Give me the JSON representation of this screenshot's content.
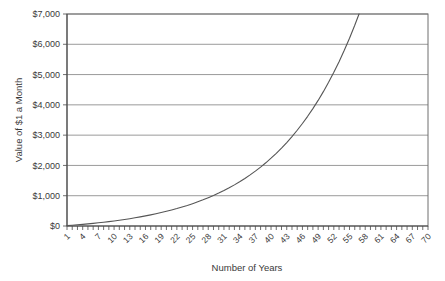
{
  "chart_data": {
    "type": "line",
    "title": "",
    "subtitle": "",
    "xlabel": "Number of Years",
    "ylabel": "Value of $1 a Month",
    "xlim": [
      1,
      70
    ],
    "ylim": [
      0,
      7000
    ],
    "grid": true,
    "legend": false,
    "legend_position": "none",
    "y_ticks": [
      0,
      1000,
      2000,
      3000,
      4000,
      5000,
      6000,
      7000
    ],
    "y_tick_labels": [
      "$0",
      "$1,000",
      "$2,000",
      "$3,000",
      "$4,000",
      "$5,000",
      "$6,000",
      "$7,000"
    ],
    "x_tick_labels": [
      "1",
      "4",
      "7",
      "10",
      "13",
      "16",
      "19",
      "22",
      "25",
      "28",
      "31",
      "34",
      "37",
      "40",
      "43",
      "46",
      "49",
      "52",
      "55",
      "58",
      "61",
      "64",
      "67",
      "70"
    ],
    "x_tick_values": [
      1,
      4,
      7,
      10,
      13,
      16,
      19,
      22,
      25,
      28,
      31,
      34,
      37,
      40,
      43,
      46,
      49,
      52,
      55,
      58,
      61,
      64,
      67,
      70
    ],
    "x_minor_tick_step": 1,
    "series": [
      {
        "name": "Value of $1 a Month",
        "color": "#555555",
        "x": [
          1,
          2,
          3,
          4,
          5,
          6,
          7,
          8,
          9,
          10,
          11,
          12,
          13,
          14,
          15,
          16,
          17,
          18,
          19,
          20,
          21,
          22,
          23,
          24,
          25,
          26,
          27,
          28,
          29,
          30,
          31,
          32,
          33,
          34,
          35,
          36,
          37,
          38,
          39,
          40,
          41,
          42,
          43,
          44,
          45,
          46,
          47,
          48,
          49,
          50,
          51,
          52,
          53,
          54,
          55,
          56,
          57,
          58,
          59,
          60,
          61,
          62,
          63,
          64,
          65,
          66,
          67,
          68,
          69,
          70
        ],
        "values": [
          12,
          25,
          39,
          54,
          70,
          87,
          105,
          124,
          145,
          167,
          190,
          215,
          242,
          270,
          301,
          333,
          367,
          404,
          443,
          485,
          529,
          576,
          627,
          680,
          738,
          799,
          864,
          934,
          1008,
          1087,
          1172,
          1262,
          1358,
          1461,
          1570,
          1687,
          1812,
          1945,
          2087,
          2239,
          2400,
          2572,
          2756,
          2952,
          3161,
          3384,
          3622,
          3876,
          4147,
          4436,
          4745,
          5074,
          5425,
          5800,
          6200,
          6627,
          7083,
          7570,
          8090,
          8646,
          9240,
          9874,
          10552,
          11276,
          12049,
          12875,
          13757,
          14700,
          15707,
          16783
        ]
      }
    ],
    "displayed_series_note": "exponential compound growth curve"
  },
  "chart_render": {
    "y_axis_title": "Value of $1 a Month",
    "x_axis_title": "Number of Years",
    "curve_points_x": [
      1,
      4,
      7,
      10,
      13,
      16,
      19,
      22,
      25,
      28,
      31,
      34,
      37,
      40,
      43,
      46,
      49,
      52,
      55,
      58,
      61,
      64,
      67,
      70
    ],
    "curve_points_y": [
      12,
      54,
      105,
      167,
      242,
      333,
      443,
      576,
      738,
      934,
      1172,
      1461,
      1812,
      2239,
      2756,
      3384,
      4147,
      5074,
      6200,
      7570,
      9240,
      11276,
      13757,
      16783
    ]
  },
  "plot_geometry": {
    "left": 67,
    "right": 428,
    "top": 14,
    "bottom": 226
  }
}
